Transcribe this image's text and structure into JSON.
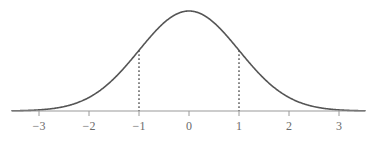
{
  "figure": {
    "width": 376,
    "height": 145,
    "background": "#ffffff"
  },
  "style": {
    "curve_color": "#555555",
    "curve_width": 1.6,
    "axis_color": "#9a9a9a",
    "axis_width": 1.1,
    "tick_color": "#9a9a9a",
    "dashed_color": "#4a4a4a",
    "label_color": "#6b6b6b"
  },
  "geometry": {
    "axis_y": 111,
    "axis_x_start": 12,
    "axis_x_end": 365,
    "origin_x": 189,
    "unit_px": 50,
    "peak_y": 11,
    "tick_length": 5,
    "tick_label_y": 119
  },
  "chart_data": {
    "type": "line",
    "title": "",
    "subtitle": "",
    "xlabel": "",
    "ylabel": "",
    "grid": false,
    "legend": "none",
    "xlim": [
      -3.54,
      3.52
    ],
    "ylim": [
      0,
      1
    ],
    "xticks": [
      -3,
      -2,
      -1,
      0,
      1,
      2,
      3
    ],
    "xtick_labels": [
      "−3",
      "−2",
      "−1",
      "0",
      "1",
      "2",
      "3"
    ],
    "yticks": [],
    "ytick_labels": [],
    "series": [
      {
        "name": "standard normal density",
        "kind": "gaussian",
        "mean": 0,
        "sigma": 1,
        "peak_value": 1.0,
        "x": [
          -3.5,
          -3.0,
          -2.5,
          -2.0,
          -1.5,
          -1.0,
          -0.5,
          0.0,
          0.5,
          1.0,
          1.5,
          2.0,
          2.5,
          3.0,
          3.5
        ],
        "y": [
          0.0022,
          0.0111,
          0.0439,
          0.1353,
          0.3247,
          0.6065,
          0.8825,
          1.0,
          0.8825,
          0.6065,
          0.3247,
          0.1353,
          0.0439,
          0.0111,
          0.0022
        ]
      }
    ],
    "annotations": [
      {
        "type": "vline",
        "style": "dotted",
        "x": -1,
        "label": "",
        "y_from": 0,
        "y_to": 0.6065
      },
      {
        "type": "vline",
        "style": "dotted",
        "x": 1,
        "label": "",
        "y_from": 0,
        "y_to": 0.6065
      }
    ]
  },
  "axis": {
    "ticks": [
      {
        "value": -3,
        "label": "−3",
        "x": 39
      },
      {
        "value": -2,
        "label": "−2",
        "x": 89
      },
      {
        "value": -1,
        "label": "−1",
        "x": 139
      },
      {
        "value": 0,
        "label": "0",
        "x": 189
      },
      {
        "value": 1,
        "label": "1",
        "x": 239
      },
      {
        "value": 2,
        "label": "2",
        "x": 289
      },
      {
        "value": 3,
        "label": "3",
        "x": 339
      }
    ]
  }
}
